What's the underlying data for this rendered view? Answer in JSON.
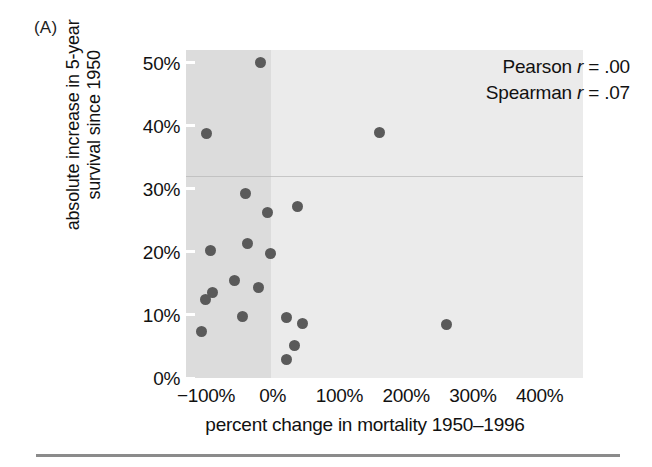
{
  "figure": {
    "panel_letter": "(A)",
    "point_color": "#5a5a5a",
    "plot_background": "#ebebeb",
    "negative_band_color": "#dcdcdc"
  },
  "annotation": {
    "pearson_prefix": "Pearson ",
    "pearson_symbol": "r",
    "pearson_value": " = .00",
    "spearman_prefix": "Spearman ",
    "spearman_symbol": "r",
    "spearman_value": " = .07"
  },
  "chart_data": {
    "type": "scatter",
    "title": "",
    "xlabel": "percent change in mortality 1950–1996",
    "ylabel": "absolute increase in 5-year survival since 1950",
    "ylabel_line1": "absolute increase in 5-year",
    "ylabel_line2": "survival since 1950",
    "xlim": [
      -130,
      465
    ],
    "ylim": [
      0,
      52
    ],
    "xticks": [
      -100,
      0,
      100,
      200,
      300,
      400
    ],
    "yticks": [
      0,
      10,
      20,
      30,
      40,
      50
    ],
    "xticklabels": [
      "−100%",
      "0%",
      "100%",
      "200%",
      "300%",
      "400%"
    ],
    "yticklabels": [
      "0%",
      "10%",
      "20%",
      "30%",
      "40%",
      "50%"
    ],
    "grid": false,
    "legend": null,
    "shaded_region": {
      "x_from": -130,
      "x_to": -2,
      "description": "darker grey band covering negative percent change in mortality"
    },
    "annotations": [
      {
        "text": "Pearson r = .00",
        "position": "top-right"
      },
      {
        "text": "Spearman r = .07",
        "position": "top-right"
      }
    ],
    "statistics": {
      "pearson_r": 0.0,
      "spearman_r": 0.07
    },
    "points": [
      {
        "x": -18,
        "y": 50.0
      },
      {
        "x": -99,
        "y": 38.8
      },
      {
        "x": 160,
        "y": 39.0
      },
      {
        "x": -41,
        "y": 29.3
      },
      {
        "x": -8,
        "y": 26.3
      },
      {
        "x": 37,
        "y": 27.2
      },
      {
        "x": -38,
        "y": 21.4
      },
      {
        "x": -93,
        "y": 20.2
      },
      {
        "x": -3,
        "y": 19.8
      },
      {
        "x": -58,
        "y": 15.4
      },
      {
        "x": -22,
        "y": 14.4
      },
      {
        "x": -91,
        "y": 13.5
      },
      {
        "x": -101,
        "y": 12.5
      },
      {
        "x": -45,
        "y": 9.7
      },
      {
        "x": 20,
        "y": 9.6
      },
      {
        "x": 44,
        "y": 8.7
      },
      {
        "x": 260,
        "y": 8.5
      },
      {
        "x": -107,
        "y": 7.4
      },
      {
        "x": 33,
        "y": 5.2
      },
      {
        "x": 21,
        "y": 3.0
      }
    ]
  }
}
